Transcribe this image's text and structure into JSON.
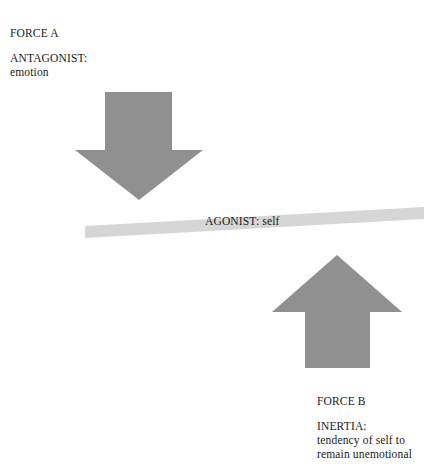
{
  "canvas": {
    "width": 432,
    "height": 468,
    "background": "#ffffff"
  },
  "colors": {
    "arrow_fill": "#909090",
    "beam_fill": "#d6d6d6",
    "text": "#1a1a1a"
  },
  "labels": {
    "force_a": "FORCE A",
    "antagonist_title": "ANTAGONIST:",
    "antagonist_body": "emotion",
    "agonist": "AGONIST: self",
    "force_b": "FORCE B",
    "inertia_title": "INERTIA:",
    "inertia_body_line1": "tendency of self to",
    "inertia_body_line2": "remain unemotional"
  },
  "shapes": {
    "arrow_down": {
      "name": "down-arrow",
      "direction": "down",
      "fill": "#909090",
      "shaft_left": 105,
      "shaft_right": 172,
      "shaft_top": 92,
      "wing_left": 75,
      "wing_right": 203,
      "wing_top": 150,
      "tip_y": 200
    },
    "arrow_up": {
      "name": "up-arrow",
      "direction": "up",
      "fill": "#909090",
      "shaft_left": 305,
      "shaft_right": 370,
      "shaft_bottom": 368,
      "wing_left": 272,
      "wing_right": 402,
      "wing_bottom": 312,
      "tip_y": 255
    },
    "beam": {
      "name": "agonist-beam",
      "fill": "#d6d6d6",
      "left_x": 85,
      "left_top_y": 226,
      "right_x": 424,
      "right_top_y": 207,
      "thickness": 12
    }
  }
}
